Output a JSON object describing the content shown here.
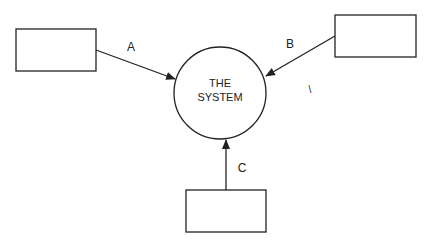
{
  "diagram": {
    "type": "context-diagram",
    "center": {
      "line1": "THE",
      "line2": "SYSTEM"
    },
    "entities": [
      {
        "id": "left",
        "label": ""
      },
      {
        "id": "right",
        "label": ""
      },
      {
        "id": "bottom",
        "label": ""
      }
    ],
    "flows": [
      {
        "from": "left",
        "to": "center",
        "label": "A"
      },
      {
        "from": "right",
        "to": "center",
        "label": "B"
      },
      {
        "from": "bottom",
        "to": "center",
        "label": "C"
      }
    ],
    "stray_mark": "\\",
    "colors": {
      "stroke": "#222222",
      "background": "#ffffff"
    }
  }
}
